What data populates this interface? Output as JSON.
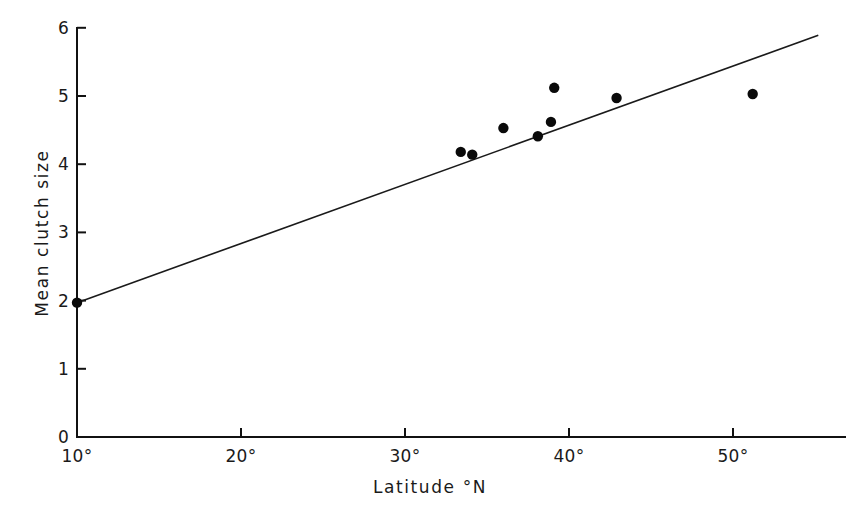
{
  "chart_data": {
    "type": "scatter",
    "title": "",
    "xlabel": "Latitude °N",
    "ylabel": "Mean clutch size",
    "xlim": [
      10,
      55.2
    ],
    "ylim": [
      0,
      6
    ],
    "grid": false,
    "legend": null,
    "xticks": [
      10,
      20,
      30,
      40,
      50
    ],
    "xticklabels": [
      "10°",
      "20°",
      "30°",
      "40°",
      "50°"
    ],
    "yticks": [
      0,
      1,
      2,
      3,
      4,
      5,
      6
    ],
    "yticklabels": [
      "0",
      "1",
      "2",
      "3",
      "4",
      "5",
      "6"
    ],
    "x": [
      10.0,
      33.4,
      34.1,
      36.0,
      38.1,
      38.9,
      39.1,
      42.9,
      51.2
    ],
    "y": [
      1.97,
      4.18,
      4.14,
      4.53,
      4.41,
      4.62,
      5.12,
      4.97,
      5.03
    ],
    "series": [
      {
        "name": "Mean clutch size by latitude",
        "marker": "filled-circle",
        "color": "#0a0a0a",
        "points": [
          {
            "x": 10.0,
            "y": 1.97
          },
          {
            "x": 33.4,
            "y": 4.18
          },
          {
            "x": 34.1,
            "y": 4.14
          },
          {
            "x": 36.0,
            "y": 4.53
          },
          {
            "x": 38.1,
            "y": 4.41
          },
          {
            "x": 38.9,
            "y": 4.62
          },
          {
            "x": 39.1,
            "y": 5.12
          },
          {
            "x": 42.9,
            "y": 4.97
          },
          {
            "x": 51.2,
            "y": 5.03
          }
        ]
      }
    ],
    "fit_line": {
      "name": "regression line",
      "color": "#1a1a1a",
      "x0": 10.0,
      "y0": 1.97,
      "x1": 55.2,
      "y1": 5.89
    }
  },
  "axes": {
    "y_axis_name": "Mean clutch size",
    "x_axis_name": "Latitude °N"
  }
}
